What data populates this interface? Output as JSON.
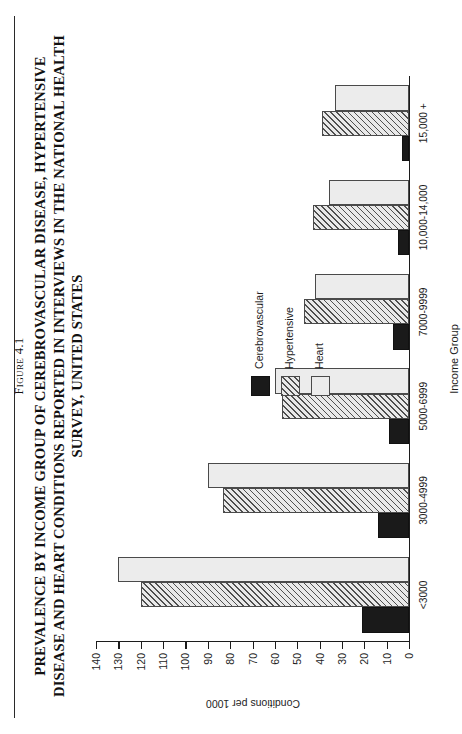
{
  "figure": {
    "number_prefix": "F",
    "number_rest": "IGURE",
    "number_label": "Figure 4.1",
    "number_small_caps": "IGURE 4.1",
    "title": "PREVALENCE BY INCOME GROUP OF CEREBROVASCULAR DISEASE, HYPERTENSIVE DISEASE AND HEART CONDITIONS REPORTED IN INTERVIEWS IN THE NATIONAL HEALTH SURVEY, UNITED STATES"
  },
  "chart_data": {
    "type": "bar",
    "orientation": "vertical",
    "title": "PREVALENCE BY INCOME GROUP OF CEREBROVASCULAR DISEASE, HYPERTENSIVE DISEASE AND HEART CONDITIONS REPORTED IN INTERVIEWS IN THE NATIONAL HEALTH SURVEY, UNITED STATES",
    "xlabel": "Income Group",
    "ylabel": "Conditions per 1000",
    "categories": [
      "<3000",
      "3000-4999",
      "5000-6999",
      "7000-9999",
      "10,000-14,000",
      "15,000 +"
    ],
    "series": [
      {
        "name": "Cerebrovascular",
        "color": "#1a1a1a",
        "fill": "solid-black",
        "values": [
          21,
          14,
          9,
          7,
          5,
          3
        ]
      },
      {
        "name": "Hypertensive",
        "color": "#e9e9e9",
        "fill": "diagonal-hatch",
        "values": [
          120,
          83,
          57,
          47,
          43,
          39
        ]
      },
      {
        "name": "Heart",
        "color": "#ececec",
        "fill": "light-gray",
        "values": [
          130,
          90,
          60,
          42,
          36,
          33
        ]
      }
    ],
    "ylim": [
      0,
      140
    ],
    "yticks": [
      0,
      10,
      20,
      30,
      40,
      50,
      60,
      70,
      80,
      90,
      100,
      110,
      120,
      130,
      140
    ],
    "ytick_labels": [
      "0",
      "10",
      "20",
      "30",
      "40",
      "50",
      "60",
      "70",
      "80",
      "90",
      "100",
      "110",
      "120",
      "130",
      "140"
    ],
    "grid": false,
    "legend_position": "upper-right-inside",
    "legend_entries": [
      "Cerebrovascular",
      "Hypertensive",
      "Heart"
    ]
  }
}
